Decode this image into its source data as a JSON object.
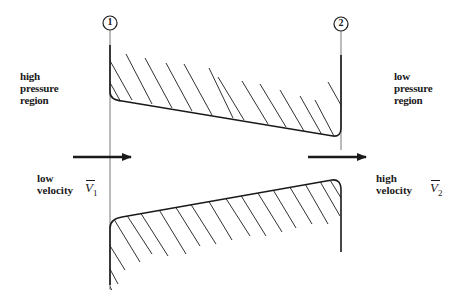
{
  "stations": [
    {
      "id": "1",
      "label": "1"
    },
    {
      "id": "2",
      "label": "2"
    }
  ],
  "regions": {
    "left": {
      "lines": [
        "high",
        "pressure",
        "region"
      ]
    },
    "right": {
      "lines": [
        "low",
        "pressure",
        "region"
      ]
    }
  },
  "velocities": {
    "inlet": {
      "line1": "low",
      "line2": "velocity",
      "symbol": "V",
      "subscript": "1"
    },
    "outlet": {
      "line1": "high",
      "line2": "velocity",
      "symbol": "V",
      "subscript": "2"
    }
  },
  "colors": {
    "ink": "#1a1a1a",
    "background": "#ffffff"
  }
}
